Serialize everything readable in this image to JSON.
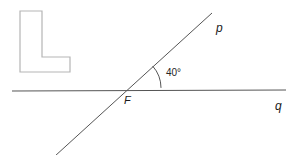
{
  "figure": {
    "type": "geometry-diagram",
    "background_color": "#ffffff",
    "stroke_color": "#555555",
    "logo_stroke_color": "#b5b5b5",
    "text_color": "#1a1a1a",
    "lines": [
      {
        "name": "p",
        "label": "p",
        "role": "transversal",
        "x1": 212,
        "y1": 13,
        "x2": 55,
        "y2": 156
      },
      {
        "name": "q",
        "label": "q",
        "role": "horizontal",
        "x1": 12,
        "y1": 91,
        "x2": 286,
        "y2": 90
      }
    ],
    "vertex": {
      "label": "F",
      "x": 128,
      "y": 88
    },
    "angle": {
      "value": "40°",
      "degrees": 40,
      "arc_radius": 33,
      "at_vertex": "F",
      "between": [
        "q",
        "p"
      ]
    },
    "logo": {
      "name": "L-shape",
      "points": "20,11 42,11 42,57 70,57 70,72 20,72"
    }
  },
  "labels": {
    "line_p": "p",
    "line_q": "q",
    "vertex_f": "F",
    "angle_measure": "40°"
  }
}
